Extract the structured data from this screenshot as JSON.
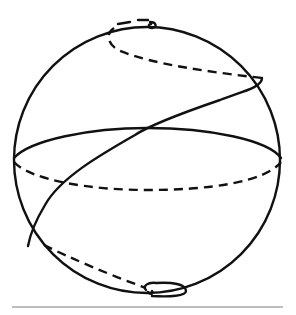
{
  "diagram": {
    "sphere": {
      "cx": 147,
      "cy": 160,
      "r": 133
    },
    "equator": {
      "cx": 147,
      "cy": 161,
      "rx": 133,
      "ry": 27,
      "front": "solid",
      "back": "dashed"
    },
    "curve": {
      "name": "loxodrome",
      "front": "solid",
      "back": "dashed",
      "ends_at": [
        "north-pole",
        "south-pole"
      ]
    },
    "ground_line": {
      "y": 307,
      "x1": 12,
      "x2": 283,
      "color": "#bdbdbd"
    },
    "colors": {
      "ink": "#111111",
      "background": "#ffffff"
    }
  }
}
